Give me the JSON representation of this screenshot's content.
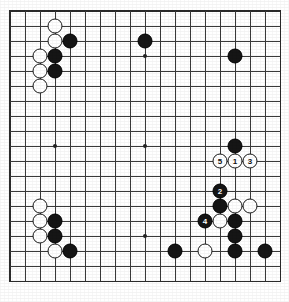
{
  "diagram": {
    "type": "go-board",
    "board_size": 19,
    "grid": {
      "origin_x": 10,
      "origin_y": 11,
      "spacing": 15,
      "lines": 19
    },
    "colors": {
      "board_background": "#ffffff",
      "grid_line": "#3a3a3a",
      "black_stone": "#151515",
      "white_stone": "#ffffff",
      "stone_outline": "#1a1a1a",
      "black_label_text": "#ffffff",
      "white_label_text": "#111111"
    },
    "hoshi_points": [
      {
        "col": 3,
        "row": 3,
        "name": "hoshi-top-left"
      },
      {
        "col": 9,
        "row": 3,
        "name": "hoshi-top"
      },
      {
        "col": 15,
        "row": 3,
        "name": "hoshi-top-right"
      },
      {
        "col": 3,
        "row": 9,
        "name": "hoshi-left"
      },
      {
        "col": 9,
        "row": 9,
        "name": "hoshi-center"
      },
      {
        "col": 15,
        "row": 9,
        "name": "hoshi-right"
      },
      {
        "col": 3,
        "row": 15,
        "name": "hoshi-bottom-left"
      },
      {
        "col": 9,
        "row": 15,
        "name": "hoshi-bottom"
      },
      {
        "col": 15,
        "row": 15,
        "name": "hoshi-bottom-right"
      }
    ],
    "stones": [
      {
        "col": 3,
        "row": 1,
        "color": "white",
        "label": ""
      },
      {
        "col": 3,
        "row": 2,
        "color": "white",
        "label": ""
      },
      {
        "col": 4,
        "row": 2,
        "color": "black",
        "label": ""
      },
      {
        "col": 2,
        "row": 3,
        "color": "white",
        "label": ""
      },
      {
        "col": 3,
        "row": 3,
        "color": "black",
        "label": ""
      },
      {
        "col": 2,
        "row": 4,
        "color": "white",
        "label": ""
      },
      {
        "col": 3,
        "row": 4,
        "color": "black",
        "label": ""
      },
      {
        "col": 2,
        "row": 5,
        "color": "white",
        "label": ""
      },
      {
        "col": 9,
        "row": 2,
        "color": "black",
        "label": ""
      },
      {
        "col": 15,
        "row": 3,
        "color": "black",
        "label": ""
      },
      {
        "col": 15,
        "row": 9,
        "color": "black",
        "label": ""
      },
      {
        "col": 14,
        "row": 10,
        "color": "white",
        "label": "5"
      },
      {
        "col": 15,
        "row": 10,
        "color": "white",
        "label": "1"
      },
      {
        "col": 16,
        "row": 10,
        "color": "white",
        "label": "3"
      },
      {
        "col": 14,
        "row": 12,
        "color": "black",
        "label": "2"
      },
      {
        "col": 14,
        "row": 13,
        "color": "black",
        "label": ""
      },
      {
        "col": 15,
        "row": 13,
        "color": "white",
        "label": ""
      },
      {
        "col": 16,
        "row": 13,
        "color": "white",
        "label": ""
      },
      {
        "col": 13,
        "row": 14,
        "color": "black",
        "label": "4"
      },
      {
        "col": 14,
        "row": 14,
        "color": "white",
        "label": ""
      },
      {
        "col": 15,
        "row": 14,
        "color": "black",
        "label": ""
      },
      {
        "col": 15,
        "row": 15,
        "color": "black",
        "label": ""
      },
      {
        "col": 2,
        "row": 13,
        "color": "white",
        "label": ""
      },
      {
        "col": 2,
        "row": 14,
        "color": "white",
        "label": ""
      },
      {
        "col": 3,
        "row": 14,
        "color": "black",
        "label": ""
      },
      {
        "col": 2,
        "row": 15,
        "color": "white",
        "label": ""
      },
      {
        "col": 3,
        "row": 15,
        "color": "black",
        "label": ""
      },
      {
        "col": 3,
        "row": 16,
        "color": "white",
        "label": ""
      },
      {
        "col": 4,
        "row": 16,
        "color": "black",
        "label": ""
      },
      {
        "col": 11,
        "row": 16,
        "color": "black",
        "label": ""
      },
      {
        "col": 13,
        "row": 16,
        "color": "white",
        "label": ""
      },
      {
        "col": 15,
        "row": 16,
        "color": "black",
        "label": ""
      },
      {
        "col": 17,
        "row": 16,
        "color": "black",
        "label": ""
      }
    ]
  }
}
